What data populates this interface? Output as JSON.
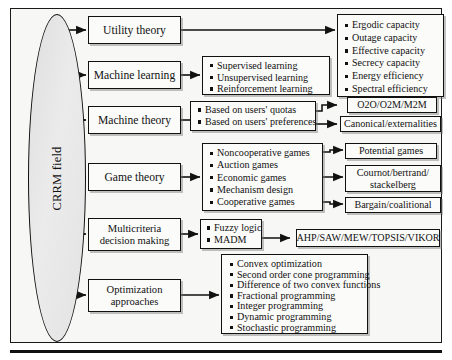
{
  "figure": {
    "root_label": "CRRM field"
  },
  "branches": [
    {
      "label": "Utility theory"
    },
    {
      "label": "Machine learning"
    },
    {
      "label": "Machine theory"
    },
    {
      "label": "Game theory"
    },
    {
      "label": "Multicriteria\ndecision making",
      "line1": "Multicriteria",
      "line2": "decision making"
    },
    {
      "label": "Optimization\napproaches",
      "line1": "Optimization",
      "line2": "approaches"
    }
  ],
  "utility_outcomes": {
    "items": [
      "Ergodic capacity",
      "Outage capacity",
      "Effective capacity",
      "Secrecy capacity",
      "Energy efficiency",
      "Spectral efficiency"
    ]
  },
  "machine_learning_items": {
    "items": [
      "Supervised learning",
      "Unsupervised learning",
      "Reinforcement learning"
    ]
  },
  "machine_theory_items": {
    "items": [
      "Based on users' quotas",
      "Based on users' preferences"
    ]
  },
  "machine_theory_outcomes": [
    {
      "label": "O2O/O2M/M2M"
    },
    {
      "label": "Canonical/externalities"
    }
  ],
  "game_theory_items": {
    "items": [
      "Noncooperative games",
      "Auction games",
      "Economic games",
      "Mechanism design",
      "Cooperative games"
    ]
  },
  "game_theory_outcomes": [
    {
      "label": "Potential games",
      "line1": "Potential games",
      "line2": ""
    },
    {
      "label": "Cournot/bertrand/ stackelberg",
      "line1": "Cournot/bertrand/",
      "line2": "stackelberg"
    },
    {
      "label": "Bargain/coalitional",
      "line1": "Bargain/coalitional",
      "line2": ""
    }
  ],
  "mcdm_items": {
    "items": [
      "Fuzzy logic",
      "MADM"
    ]
  },
  "mcdm_outcome": {
    "label": "AHP/SAW/MEW/TOPSIS/VIKOR"
  },
  "optimization_items": {
    "items": [
      "Convex optimization",
      "Second order cone programming",
      "Difference of two convex functions",
      "Fractional programming",
      "Integer programming",
      "Dynamic programming",
      "Stochastic programming"
    ]
  },
  "colors": {
    "ink": "#111111",
    "ellipse_fill": "#e4e4e4",
    "panel_bg": "#f7f7f5",
    "box_bg": "#fbfbfa"
  }
}
